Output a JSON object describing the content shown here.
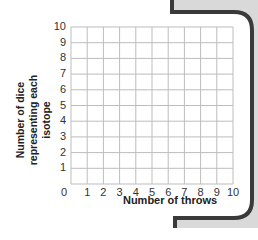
{
  "chart_data": {
    "type": "line",
    "title": "",
    "xlabel": "Number of throws",
    "ylabel": "Number of dice representing each isotope",
    "ylabel_lines": [
      "Number of dice",
      "representing each isotope"
    ],
    "xlim": [
      0,
      10
    ],
    "ylim": [
      0,
      10
    ],
    "x_ticks": [
      "0",
      "1",
      "2",
      "3",
      "4",
      "5",
      "6",
      "7",
      "8",
      "9",
      "10"
    ],
    "y_ticks": [
      "0",
      "1",
      "2",
      "3",
      "4",
      "5",
      "6",
      "7",
      "8",
      "9",
      "10"
    ],
    "grid": true,
    "series": [],
    "note": "Blank grid for plotting; no data points shown"
  },
  "colors": {
    "grid": "#bdbdbd",
    "frame": "#3a3a3a",
    "panel": "#d9d9d9",
    "text": "#222222"
  }
}
